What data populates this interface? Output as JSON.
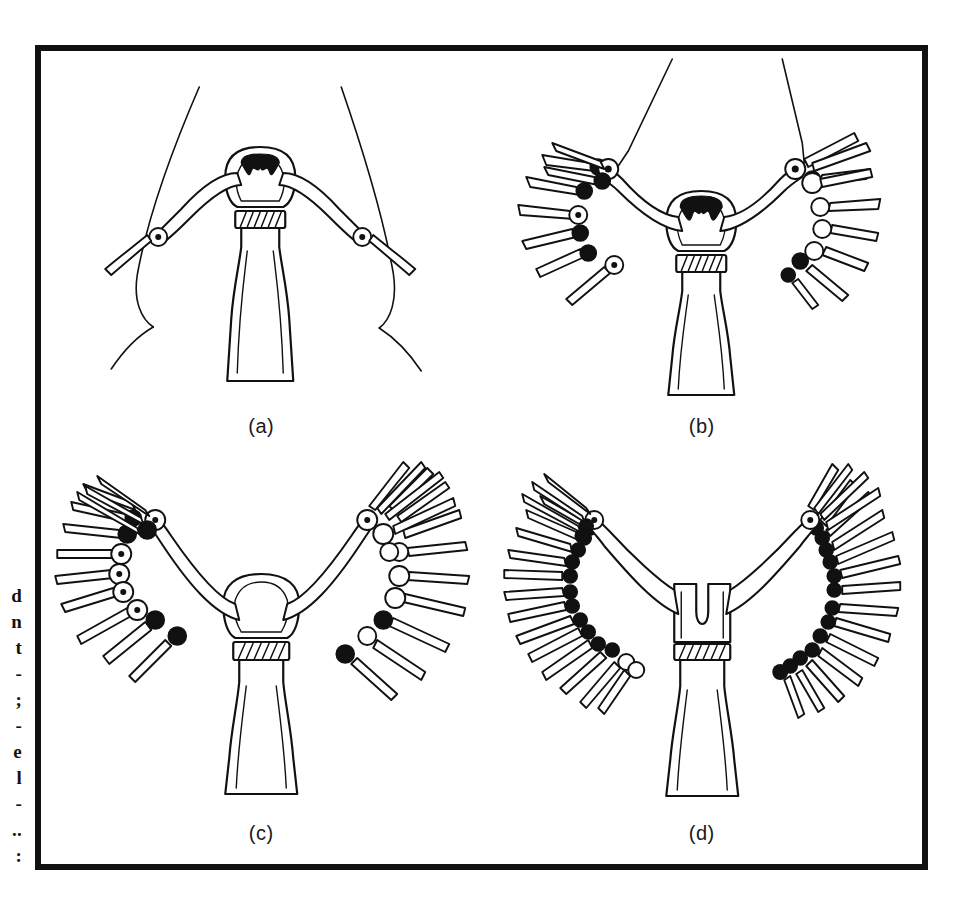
{
  "document": {
    "type": "scanned-figure-page",
    "background_color": "#ffffff",
    "ink_color": "#111111"
  },
  "margin_text": {
    "description": "right-edge fragments of cut-off body text in the page margin",
    "lines": [
      "d",
      "n",
      "t",
      "-",
      ";",
      "-",
      "e",
      "l",
      "-",
      "..",
      ":"
    ]
  },
  "figure": {
    "frame": {
      "border_color": "#111111",
      "border_width_px": 6
    },
    "panels": [
      {
        "id": "a",
        "label": "(a)",
        "stage": 1,
        "tentacle_pairs": 1,
        "arm_tentacles_left": 1,
        "arm_tentacles_right": 1,
        "free_tentacles_left": 0,
        "free_tentacles_right": 0,
        "has_long_filaments": true,
        "hypostome_visible": true,
        "collar_band": true
      },
      {
        "id": "b",
        "label": "(b)",
        "stage": 2,
        "tentacle_pairs": 9,
        "arm_tentacles_left": 2,
        "arm_tentacles_right": 3,
        "free_tentacles_left": 6,
        "free_tentacles_right": 6,
        "has_long_filaments": true,
        "hypostome_visible": true,
        "collar_band": true
      },
      {
        "id": "c",
        "label": "(c)",
        "stage": 3,
        "tentacle_pairs": 13,
        "arm_tentacles_left": 3,
        "arm_tentacles_right": 4,
        "free_tentacles_left": 9,
        "free_tentacles_right": 9,
        "has_long_filaments": false,
        "hypostome_visible": false,
        "collar_band": true
      },
      {
        "id": "d",
        "label": "(d)",
        "stage": 4,
        "tentacle_pairs": 18,
        "arm_tentacles_left": 6,
        "arm_tentacles_right": 7,
        "free_tentacles_left": 13,
        "free_tentacles_right": 13,
        "has_long_filaments": false,
        "hypostome_visible": false,
        "collar_band": true
      }
    ]
  }
}
